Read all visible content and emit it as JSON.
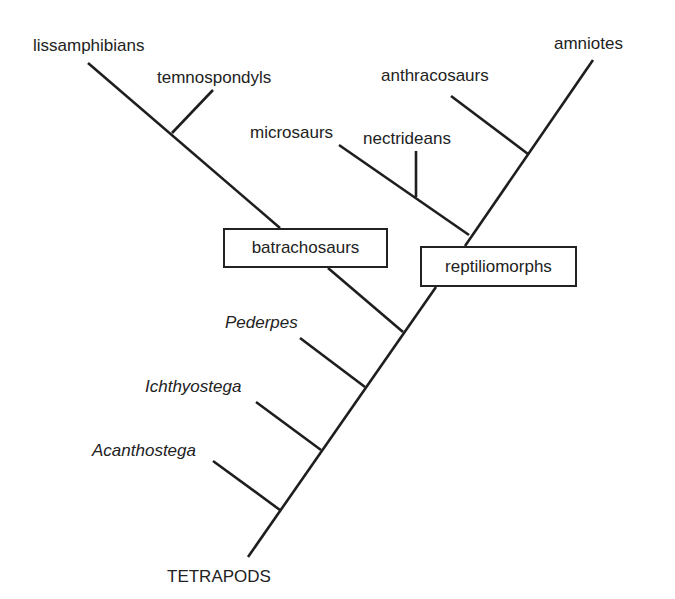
{
  "diagram": {
    "type": "cladogram",
    "root": "TETRAPODS",
    "taxa": {
      "lissamphibians": "lissamphibians",
      "temnospondyls": "temnospondyls",
      "microsaurs": "microsaurs",
      "nectrideans": "nectrideans",
      "anthracosaurs": "anthracosaurs",
      "amniotes": "amniotes",
      "pederpes": "Pederpes",
      "ichthyostega": "Ichthyostega",
      "acanthostega": "Acanthostega"
    },
    "clades": {
      "batrachosaurs": "batrachosaurs",
      "reptiliomorphs": "reptiliomorphs"
    },
    "line_color": "#1e1e1e"
  }
}
